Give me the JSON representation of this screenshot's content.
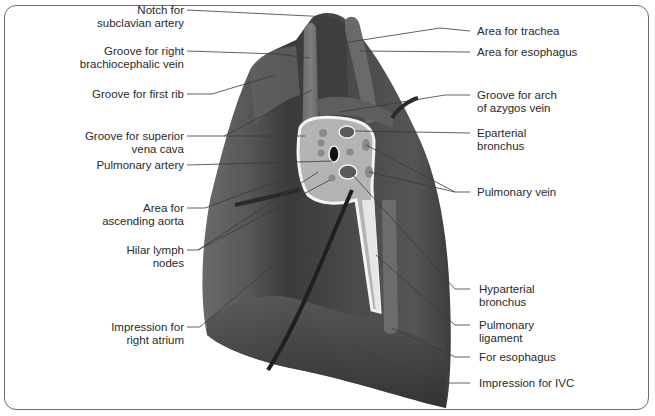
{
  "diagram": {
    "colors": {
      "lung": "#4a4a4a",
      "lung_light": "#6e6e6e",
      "lung_dark": "#2e2e2e",
      "hilum_fill": "#b9b9b9",
      "hilum_border": "#f2f2f2",
      "leader_line": "#3a3a3a",
      "frame": "#6a6a6a",
      "text": "#2a2a2a"
    },
    "labels_left": [
      {
        "id": "notch-subclavian-artery",
        "text": "Notch for\nsubclavian artery"
      },
      {
        "id": "groove-right-brachiocephalic-vein",
        "text": "Groove for right\nbrachiocephalic vein"
      },
      {
        "id": "groove-first-rib",
        "text": "Groove for first rib"
      },
      {
        "id": "groove-superior-vena-cava",
        "text": "Groove for superior\nvena cava"
      },
      {
        "id": "pulmonary-artery",
        "text": "Pulmonary artery"
      },
      {
        "id": "area-ascending-aorta",
        "text": "Area for\nascending aorta"
      },
      {
        "id": "hilar-lymph-nodes",
        "text": "Hilar lymph\nnodes"
      },
      {
        "id": "impression-right-atrium",
        "text": "Impression for\nright atrium"
      }
    ],
    "labels_right": [
      {
        "id": "area-trachea",
        "text": "Area for trachea"
      },
      {
        "id": "area-esophagus",
        "text": "Area for esophagus"
      },
      {
        "id": "groove-arch-azygos-vein",
        "text": "Groove for arch\nof azygos vein"
      },
      {
        "id": "eparterial-bronchus",
        "text": "Eparterial\nbronchus"
      },
      {
        "id": "pulmonary-vein",
        "text": "Pulmonary vein"
      },
      {
        "id": "hyparterial-bronchus",
        "text": "Hyparterial\nbronchus"
      },
      {
        "id": "pulmonary-ligament",
        "text": "Pulmonary\nligament"
      },
      {
        "id": "for-esophagus",
        "text": "For esophagus"
      },
      {
        "id": "impression-ivc",
        "text": "Impression for IVC"
      }
    ]
  }
}
